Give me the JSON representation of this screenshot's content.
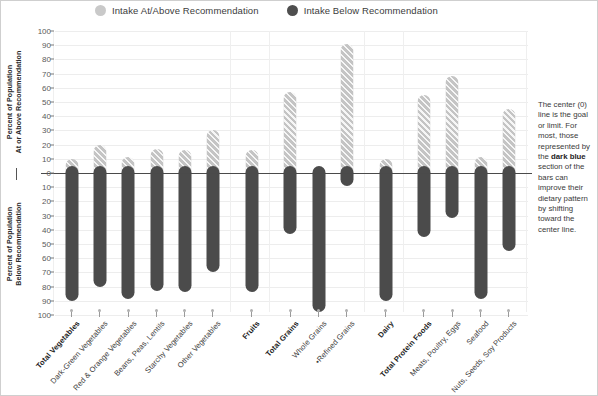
{
  "legend": {
    "items": [
      {
        "label": "Intake At/Above Recommendation",
        "color": "#c9c9c9",
        "icon": "circle-swatch-light"
      },
      {
        "label": "Intake Below Recommendation",
        "color": "#4e4e4e",
        "icon": "circle-swatch-dark"
      }
    ]
  },
  "axes": {
    "above": {
      "line1": "Percent of Population",
      "line2": "At or Above Recommendation"
    },
    "below": {
      "line1": "Percent of Population",
      "line2": "Below Recommendation"
    },
    "ticks_above": [
      "100",
      "90",
      "80",
      "70",
      "60",
      "50",
      "40",
      "30",
      "20",
      "10",
      "0"
    ],
    "ticks_below": [
      "0",
      "10",
      "20",
      "30",
      "40",
      "50",
      "60",
      "70",
      "80",
      "90",
      "100"
    ]
  },
  "callout": {
    "line1": "The center (0)",
    "line2": "line is the",
    "line3": "goal or limit.",
    "line4": "For most, those",
    "line5": "represented by",
    "line6": "the ",
    "bold": "dark blue",
    "line7": "section of the",
    "line8": "bars can",
    "line9": "improve their",
    "line10": "dietary pattern",
    "line11": "by shifting",
    "line12": "toward the",
    "line13": "center line."
  },
  "chart_data": {
    "type": "bar",
    "title": "",
    "subtitle": "",
    "xlabel": "",
    "ylabel": "Percent of Population",
    "ylim": [
      -100,
      100
    ],
    "grid": true,
    "legend_position": "top",
    "note": "Diverging bar chart. Positive axis = Percent of Population At or Above Recommendation; negative axis = Percent of Population Below Recommendation.",
    "categories": [
      "Total Vegetables",
      "Dark-Green Vegetables",
      "Red & Orange Vegetables",
      "Beans, Peas, Lentils",
      "Starchy Vegetables",
      "Other Vegetables",
      "Fruits",
      "Total Grains",
      "Whole Grains",
      "•Refined Grains",
      "Dairy",
      "Total Protein Foods",
      "Meats, Poultry, Eggs",
      "Seafood",
      "Nuts, Seeds, Soy Products"
    ],
    "category_bold": [
      true,
      false,
      false,
      false,
      false,
      false,
      true,
      true,
      false,
      false,
      true,
      true,
      false,
      false,
      false
    ],
    "series": [
      {
        "name": "Intake At/Above Recommendation",
        "color": "#c4c4c4",
        "values": [
          10,
          20,
          11,
          17,
          16,
          30,
          16,
          57,
          2,
          91,
          10,
          55,
          68,
          11,
          45
        ]
      },
      {
        "name": "Intake Below Recommendation",
        "color": "#4b4b4b",
        "values": [
          90,
          80,
          89,
          83,
          84,
          70,
          84,
          43,
          98,
          9,
          90,
          45,
          32,
          89,
          55
        ]
      }
    ],
    "group_gaps_after": [
      5,
      6,
      9,
      10
    ]
  }
}
